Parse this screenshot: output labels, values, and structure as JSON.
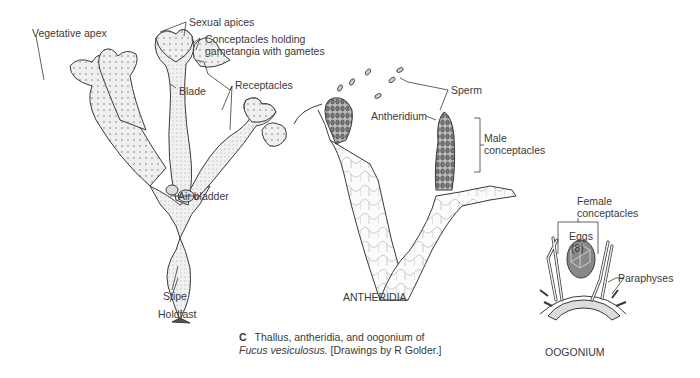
{
  "figure": {
    "panel_letter": "C",
    "caption_line1": "Thallus, antheridia, and oogonium of",
    "caption_species": "Fucus vesiculosus.",
    "caption_credit": " [Drawings by R Golder.]"
  },
  "thallus_labels": {
    "vegetative_apex": "Vegetative apex",
    "sexual_apices": "Sexual apices",
    "conceptacles_1": "Conceptacles holding",
    "conceptacles_2": "gametangia with gametes",
    "receptacles": "Receptacles",
    "blade": "Blade",
    "air_bladder": "Air bladder",
    "stipe": "Stipe",
    "holdfast": "Holdfast"
  },
  "antheridia_labels": {
    "sperm": "Sperm",
    "antheridium": "Antheridium",
    "male_1": "Male",
    "male_2": "conceptacles",
    "title": "ANTHERIDIA"
  },
  "oogonium_labels": {
    "female_1": "Female",
    "female_2": "conceptacles",
    "eggs": "Eggs",
    "eggs_count": "(8)",
    "paraphyses": "Paraphyses",
    "title": "OOGONIUM"
  },
  "colors": {
    "ink": "#3a3a3a",
    "fill_light": "#ececec",
    "fill_dark": "#9a9a9a"
  }
}
